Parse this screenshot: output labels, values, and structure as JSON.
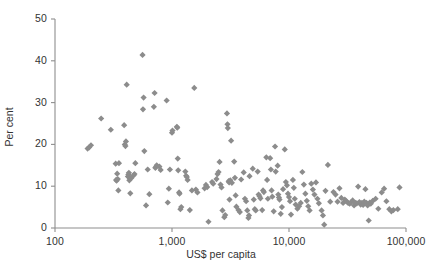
{
  "chart_data": {
    "type": "scatter",
    "title": "",
    "xlabel": "US$ per capita",
    "ylabel": "Per cent",
    "xscale": "log",
    "yscale": "linear",
    "xlim": [
      100,
      100000
    ],
    "ylim": [
      0,
      50
    ],
    "grid": false,
    "legend": null,
    "marker": "diamond",
    "marker_color": "#8c8c8c",
    "marker_size_px": 5,
    "xticks": [
      100,
      1000,
      10000,
      100000
    ],
    "xtick_labels": [
      "100",
      "1,000",
      "10,000",
      "100,000"
    ],
    "yticks": [
      0,
      10,
      20,
      30,
      40,
      50
    ],
    "ytick_labels": [
      "0",
      "10",
      "20",
      "30",
      "40",
      "50"
    ],
    "points": [
      [
        190,
        19.0
      ],
      [
        196,
        19.3
      ],
      [
        203,
        19.8
      ],
      [
        248,
        26.2
      ],
      [
        300,
        23.5
      ],
      [
        330,
        15.4
      ],
      [
        333,
        11.5
      ],
      [
        336,
        11.3
      ],
      [
        340,
        13.0
      ],
      [
        344,
        11.7
      ],
      [
        348,
        9.0
      ],
      [
        352,
        15.5
      ],
      [
        390,
        24.6
      ],
      [
        395,
        20.0
      ],
      [
        400,
        19.6
      ],
      [
        404,
        20.7
      ],
      [
        410,
        34.3
      ],
      [
        420,
        12.3
      ],
      [
        424,
        12.8
      ],
      [
        428,
        13.2
      ],
      [
        432,
        11.4
      ],
      [
        436,
        12.1
      ],
      [
        440,
        8.3
      ],
      [
        448,
        11.9
      ],
      [
        470,
        12.6
      ],
      [
        478,
        12.9
      ],
      [
        486,
        15.5
      ],
      [
        560,
        41.4
      ],
      [
        565,
        28.4
      ],
      [
        572,
        31.2
      ],
      [
        580,
        18.4
      ],
      [
        600,
        5.4
      ],
      [
        620,
        14.0
      ],
      [
        640,
        8.1
      ],
      [
        700,
        29.0
      ],
      [
        710,
        32.3
      ],
      [
        720,
        14.4
      ],
      [
        730,
        14.6
      ],
      [
        740,
        15.0
      ],
      [
        780,
        14.7
      ],
      [
        800,
        13.9
      ],
      [
        900,
        30.5
      ],
      [
        920,
        6.1
      ],
      [
        940,
        9.4
      ],
      [
        960,
        14.0
      ],
      [
        1000,
        22.8
      ],
      [
        1010,
        23.3
      ],
      [
        1100,
        24.2
      ],
      [
        1110,
        24.0
      ],
      [
        1120,
        16.6
      ],
      [
        1130,
        13.8
      ],
      [
        1150,
        8.5
      ],
      [
        1160,
        8.2
      ],
      [
        1180,
        4.5
      ],
      [
        1200,
        5.0
      ],
      [
        1300,
        13.5
      ],
      [
        1320,
        12.5
      ],
      [
        1340,
        12.2
      ],
      [
        1360,
        11.5
      ],
      [
        1420,
        4.3
      ],
      [
        1480,
        9.0
      ],
      [
        1550,
        33.5
      ],
      [
        1600,
        9.2
      ],
      [
        1650,
        8.5
      ],
      [
        1900,
        9.5
      ],
      [
        1950,
        10.3
      ],
      [
        2000,
        9.8
      ],
      [
        2050,
        1.5
      ],
      [
        2200,
        11.0
      ],
      [
        2250,
        10.6
      ],
      [
        2400,
        11.7
      ],
      [
        2450,
        12.9
      ],
      [
        2500,
        13.4
      ],
      [
        2550,
        15.8
      ],
      [
        2600,
        10.4
      ],
      [
        2650,
        9.7
      ],
      [
        2700,
        4.2
      ],
      [
        2800,
        2.6
      ],
      [
        2850,
        3.1
      ],
      [
        2950,
        27.4
      ],
      [
        2980,
        24.8
      ],
      [
        3000,
        23.9
      ],
      [
        3050,
        11.2
      ],
      [
        3080,
        10.9
      ],
      [
        3100,
        6.8
      ],
      [
        3150,
        11.4
      ],
      [
        3200,
        20.9
      ],
      [
        3250,
        10.8
      ],
      [
        3400,
        15.9
      ],
      [
        3450,
        12.0
      ],
      [
        3500,
        7.8
      ],
      [
        3550,
        5.1
      ],
      [
        3700,
        4.3
      ],
      [
        3800,
        3.8
      ],
      [
        3900,
        11.6
      ],
      [
        4100,
        13.3
      ],
      [
        4200,
        7.0
      ],
      [
        4300,
        6.4
      ],
      [
        4400,
        4.2
      ],
      [
        4500,
        2.4
      ],
      [
        4550,
        3.0
      ],
      [
        4600,
        12.4
      ],
      [
        4900,
        14.2
      ],
      [
        5000,
        6.8
      ],
      [
        5100,
        4.5
      ],
      [
        5200,
        4.2
      ],
      [
        5400,
        13.5
      ],
      [
        5500,
        8.0
      ],
      [
        5600,
        7.6
      ],
      [
        5700,
        7.1
      ],
      [
        5900,
        4.3
      ],
      [
        6000,
        9.0
      ],
      [
        6100,
        8.6
      ],
      [
        6400,
        16.9
      ],
      [
        6500,
        11.5
      ],
      [
        6600,
        7.0
      ],
      [
        6900,
        16.7
      ],
      [
        7000,
        14.0
      ],
      [
        7100,
        9.0
      ],
      [
        7200,
        7.5
      ],
      [
        7400,
        4.0
      ],
      [
        7600,
        19.5
      ],
      [
        7700,
        13.5
      ],
      [
        8000,
        14.9
      ],
      [
        8100,
        8.0
      ],
      [
        8200,
        7.3
      ],
      [
        8300,
        6.8
      ],
      [
        8500,
        3.4
      ],
      [
        8700,
        5.0
      ],
      [
        8900,
        9.3
      ],
      [
        9200,
        18.8
      ],
      [
        9400,
        11.0
      ],
      [
        9600,
        10.2
      ],
      [
        9800,
        8.2
      ],
      [
        10000,
        7.4
      ],
      [
        10200,
        6.4
      ],
      [
        10400,
        3.2
      ],
      [
        10800,
        11.5
      ],
      [
        11000,
        9.6
      ],
      [
        11200,
        7.0
      ],
      [
        11400,
        5.6
      ],
      [
        11800,
        4.6
      ],
      [
        12200,
        5.2
      ],
      [
        12600,
        6.0
      ],
      [
        13000,
        13.4
      ],
      [
        13400,
        10.4
      ],
      [
        13800,
        8.2
      ],
      [
        14200,
        6.5
      ],
      [
        14600,
        5.2
      ],
      [
        15000,
        4.2
      ],
      [
        15500,
        10.6
      ],
      [
        16000,
        9.2
      ],
      [
        16500,
        8.0
      ],
      [
        17000,
        10.9
      ],
      [
        17500,
        7.0
      ],
      [
        18000,
        5.9
      ],
      [
        19000,
        4.2
      ],
      [
        19500,
        3.0
      ],
      [
        20000,
        0.8
      ],
      [
        20500,
        8.9
      ],
      [
        21500,
        15.1
      ],
      [
        22500,
        6.3
      ],
      [
        24000,
        8.6
      ],
      [
        25000,
        8.0
      ],
      [
        26000,
        6.3
      ],
      [
        27000,
        9.5
      ],
      [
        28000,
        7.2
      ],
      [
        29000,
        6.0
      ],
      [
        30000,
        6.8
      ],
      [
        31000,
        6.4
      ],
      [
        32000,
        6.0
      ],
      [
        33000,
        5.8
      ],
      [
        34000,
        6.2
      ],
      [
        35000,
        6.6
      ],
      [
        36000,
        5.4
      ],
      [
        37000,
        6.0
      ],
      [
        38000,
        5.9
      ],
      [
        39000,
        9.9
      ],
      [
        40000,
        6.2
      ],
      [
        41000,
        5.6
      ],
      [
        42000,
        6.0
      ],
      [
        43000,
        5.5
      ],
      [
        44000,
        6.3
      ],
      [
        45000,
        9.3
      ],
      [
        46000,
        6.0
      ],
      [
        47000,
        5.4
      ],
      [
        48000,
        1.8
      ],
      [
        49000,
        6.1
      ],
      [
        50000,
        5.8
      ],
      [
        52000,
        6.5
      ],
      [
        55000,
        7.0
      ],
      [
        58000,
        4.6
      ],
      [
        62000,
        8.5
      ],
      [
        65000,
        9.4
      ],
      [
        68000,
        6.4
      ],
      [
        72000,
        4.5
      ],
      [
        75000,
        4.0
      ],
      [
        78000,
        4.3
      ],
      [
        85000,
        4.5
      ],
      [
        88000,
        9.7
      ]
    ]
  },
  "axes": {
    "x_title": "US$ per capita",
    "y_title": "Per cent"
  }
}
